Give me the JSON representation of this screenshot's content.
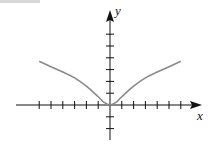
{
  "chart_data": {
    "type": "line",
    "title": "",
    "xlabel": "x",
    "ylabel": "y",
    "xlim": [
      -6,
      6
    ],
    "ylim": [
      -2,
      6
    ],
    "grid": false,
    "x_ticks": [
      -6,
      -5,
      -4,
      -3,
      -2,
      -1,
      1,
      2,
      3,
      4,
      5,
      6
    ],
    "y_ticks": [
      -2,
      -1,
      1,
      2,
      3,
      4,
      5,
      6
    ],
    "tick_labels_shown": false,
    "series": [
      {
        "name": "curve",
        "color": "#8a8a8a",
        "x": [
          -6,
          -5,
          -4,
          -3,
          -2,
          -1,
          -0.5,
          0,
          0.5,
          1,
          2,
          3,
          4,
          5,
          6
        ],
        "y": [
          3.7,
          3.25,
          2.8,
          2.3,
          1.6,
          0.7,
          0.22,
          0,
          0.22,
          0.7,
          1.6,
          2.3,
          2.8,
          3.25,
          3.7
        ]
      }
    ]
  },
  "labels": {
    "x_axis": "x",
    "y_axis": "y"
  },
  "colors": {
    "axes": "#111111",
    "curve": "#8a8a8a"
  }
}
